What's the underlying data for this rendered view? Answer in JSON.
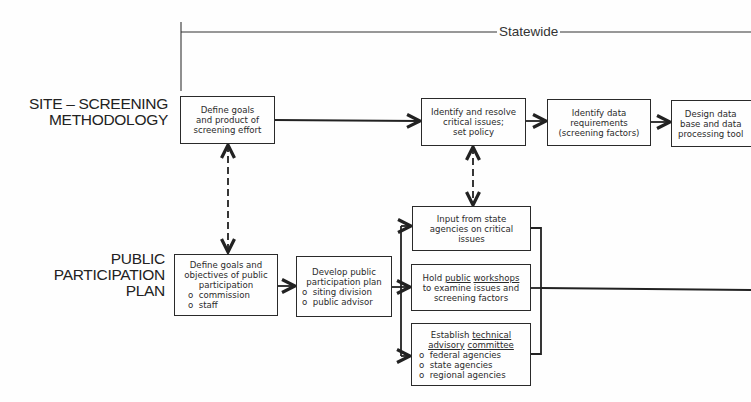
{
  "diagram": {
    "scope_label": "Statewide",
    "lanes": [
      {
        "id": "ssm",
        "label": "SITE – SCREENING\nMETHODOLOGY"
      },
      {
        "id": "ppp",
        "label": "PUBLIC\nPARTICIPATION\nPLAN"
      }
    ],
    "ssm_boxes": [
      {
        "id": "ssm1",
        "text": "Define goals\nand product of\nscreening effort"
      },
      {
        "id": "ssm2",
        "text": "Identify and resolve\ncritical issues;\nset policy"
      },
      {
        "id": "ssm3",
        "text": "Identify data\nrequirements\n(screening factors)"
      },
      {
        "id": "ssm4",
        "text": "Design data\nbase and data\nprocessing tool"
      }
    ],
    "ppp_boxes": [
      {
        "id": "ppp1",
        "text": "Define goals and\nobjectives of public\nparticipation",
        "items": [
          "commission",
          "staff"
        ]
      },
      {
        "id": "ppp2",
        "text": "Develop public\nparticipation plan",
        "items": [
          "siting division",
          "public advisor"
        ]
      }
    ],
    "parallel_boxes": [
      {
        "id": "par1",
        "text": "Input from state\nagencies on critical\nissues"
      },
      {
        "id": "par2",
        "pre": "Hold ",
        "u1": "public",
        "mid": " ",
        "u2": "workshops",
        "rest": "to examine issues and\nscreening factors"
      },
      {
        "id": "par3",
        "pre": "Establish ",
        "u1": "technical",
        "u2a": "advisory",
        "mid": " ",
        "u2": "committee",
        "items": [
          "federal agencies",
          "state agencies",
          "regional agencies"
        ]
      }
    ],
    "connectors": [
      {
        "from": "ssm1",
        "to": "ssm2",
        "style": "solid"
      },
      {
        "from": "ssm2",
        "to": "ssm3",
        "style": "solid"
      },
      {
        "from": "ssm3",
        "to": "ssm4",
        "style": "solid"
      },
      {
        "from": "ssm1",
        "to": "ppp1",
        "style": "dashed-bidirectional"
      },
      {
        "from": "ssm2",
        "to": "par1",
        "style": "dashed-bidirectional"
      },
      {
        "from": "ppp1",
        "to": "ppp2",
        "style": "solid"
      },
      {
        "from": "ppp2",
        "to": "par1",
        "style": "solid"
      },
      {
        "from": "ppp2",
        "to": "par2",
        "style": "solid"
      },
      {
        "from": "ppp2",
        "to": "par3",
        "style": "solid"
      }
    ]
  }
}
